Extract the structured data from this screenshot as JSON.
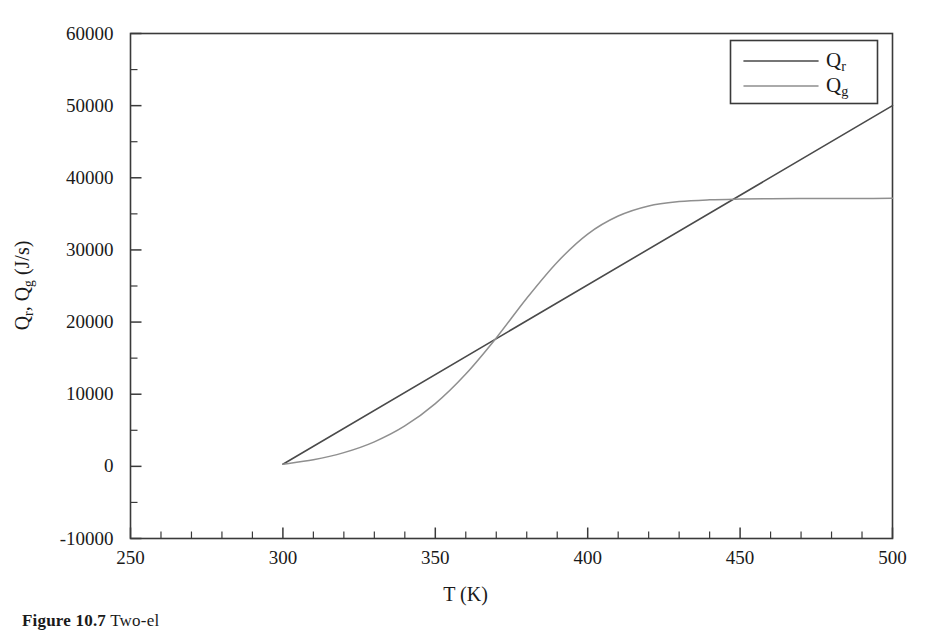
{
  "figure": {
    "caption_prefix": "Figure 10.7",
    "caption_text": "Two-el"
  },
  "axes": {
    "x_title": "T (K)",
    "y_title_main": "Q",
    "y_title_sub1": "r",
    "y_title_mid": ", Q",
    "y_title_sub2": "g",
    "y_title_units": " (J/s)",
    "y_title_plain": "Q_r, Q_g (J/s)",
    "x_tick_labels": [
      "250",
      "300",
      "350",
      "400",
      "450",
      "500"
    ],
    "y_tick_labels": [
      "-10000",
      "0",
      "10000",
      "20000",
      "30000",
      "40000",
      "50000",
      "60000"
    ]
  },
  "legend": {
    "position": "upper-right",
    "entries": [
      {
        "label_main": "Q",
        "label_sub": "r",
        "label_plain": "Q_r",
        "color": "#4a4a4a"
      },
      {
        "label_main": "Q",
        "label_sub": "g",
        "label_plain": "Q_g",
        "color": "#8f8f8f"
      }
    ]
  },
  "chart_data": {
    "type": "line",
    "title": "",
    "xlabel": "T (K)",
    "ylabel": "Q_r, Q_g (J/s)",
    "xlim": [
      250,
      500
    ],
    "ylim": [
      -10000,
      60000
    ],
    "xticks": [
      250,
      300,
      350,
      400,
      450,
      500
    ],
    "yticks": [
      -10000,
      0,
      10000,
      20000,
      30000,
      40000,
      50000,
      60000
    ],
    "x_minor_tick_step": 10,
    "y_minor_tick_step": 5000,
    "grid": false,
    "legend_position": "upper right",
    "x": [
      300,
      310,
      320,
      330,
      340,
      350,
      360,
      370,
      380,
      390,
      400,
      410,
      420,
      430,
      440,
      450,
      460,
      470,
      480,
      490,
      500
    ],
    "series": [
      {
        "name": "Q_r",
        "color": "#4a4a4a",
        "linewidth": 1.6,
        "values": [
          300,
          2785,
          5270,
          7755,
          10240,
          12725,
          15210,
          17695,
          20180,
          22665,
          25150,
          27635,
          30120,
          32605,
          35090,
          37575,
          40060,
          42545,
          45030,
          47515,
          50000
        ]
      },
      {
        "name": "Q_g",
        "color": "#8f8f8f",
        "linewidth": 1.5,
        "values": [
          300,
          900,
          1900,
          3400,
          5600,
          8700,
          12800,
          17800,
          23300,
          28300,
          32200,
          34700,
          36100,
          36700,
          36950,
          37050,
          37100,
          37120,
          37130,
          37140,
          37150
        ]
      }
    ],
    "annotations": {
      "intersections": [
        {
          "x": 348,
          "y": 12300
        },
        {
          "x": 446,
          "y": 36700
        }
      ],
      "qg_plateau": 37150,
      "qg_inflection_x": 380,
      "start_point": {
        "x": 300,
        "y": 300
      }
    }
  }
}
